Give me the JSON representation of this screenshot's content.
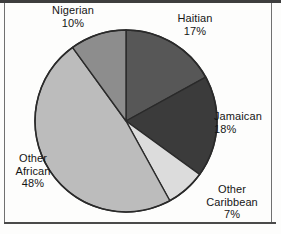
{
  "figure": {
    "background_color": "#fdfdfc",
    "frame_color": "#3e3e3e"
  },
  "chart_data": {
    "type": "pie",
    "title": "",
    "subtitle": "",
    "xlabel": "",
    "ylabel": "",
    "legend_position": "none",
    "grid": false,
    "label_format": "name + percent",
    "start_angle_deg": 0,
    "direction": "clockwise",
    "units": "percent",
    "total": 100,
    "categories": [
      "Haitian",
      "Jamaican",
      "Other Caribbean",
      "Other African",
      "Nigerian"
    ],
    "values": [
      17,
      18,
      7,
      48,
      10
    ],
    "slices": [
      {
        "name": "Haitian",
        "value": 17,
        "value_label": "17%",
        "color": "#575757",
        "start_deg": 0,
        "end_deg": 61.2
      },
      {
        "name": "Jamaican",
        "value": 18,
        "value_label": "18%",
        "color": "#3b3b3b",
        "start_deg": 61.2,
        "end_deg": 126.0
      },
      {
        "name": "Other Caribbean",
        "value": 7,
        "value_label": "7%",
        "color": "#dcdcdc",
        "start_deg": 126.0,
        "end_deg": 151.2
      },
      {
        "name": "Other African",
        "value": 48,
        "value_label": "48%",
        "color": "#bcbcbc",
        "start_deg": 151.2,
        "end_deg": 324.0
      },
      {
        "name": "Nigerian",
        "value": 10,
        "value_label": "10%",
        "color": "#8d8d8d",
        "start_deg": 324.0,
        "end_deg": 360.0
      }
    ],
    "outline_color": "#2a2a2a"
  },
  "labels": {
    "nigerian": {
      "name": "Nigerian",
      "value": "10%"
    },
    "haitian": {
      "name": "Haitian",
      "value": "17%"
    },
    "jamaican": {
      "name": "Jamaican",
      "value": "18%"
    },
    "other_caribbean": {
      "name_line1": "Other",
      "name_line2": "Caribbean",
      "value": "7%"
    },
    "other_african": {
      "name_line1": "Other",
      "name_line2": "African",
      "value": "48%"
    }
  }
}
